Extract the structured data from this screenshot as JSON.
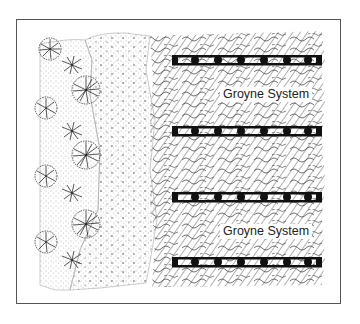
{
  "diagram": {
    "title": "",
    "labels": [
      {
        "text": "Groyne System",
        "x": 222,
        "y": 87
      },
      {
        "text": "Groyne System",
        "x": 222,
        "y": 224
      }
    ],
    "zones": [
      "vegetated dune with shrubs",
      "sand beach (stippled)",
      "water (hatched)"
    ],
    "groynes": [
      {
        "y": 60,
        "x1": 172,
        "x2": 322
      },
      {
        "y": 131,
        "x1": 172,
        "x2": 322
      },
      {
        "y": 197,
        "x1": 172,
        "x2": 322
      },
      {
        "y": 262,
        "x1": 172,
        "x2": 322
      }
    ],
    "shrubs": [
      {
        "x": 50,
        "y": 49,
        "r": 12
      },
      {
        "x": 72,
        "y": 65,
        "r": 11
      },
      {
        "x": 85,
        "y": 89,
        "r": 15
      },
      {
        "x": 46,
        "y": 108,
        "r": 12
      },
      {
        "x": 72,
        "y": 131,
        "r": 11
      },
      {
        "x": 86,
        "y": 155,
        "r": 15
      },
      {
        "x": 46,
        "y": 176,
        "r": 12
      },
      {
        "x": 72,
        "y": 191,
        "r": 11
      },
      {
        "x": 86,
        "y": 224,
        "r": 15
      },
      {
        "x": 46,
        "y": 242,
        "r": 12
      },
      {
        "x": 72,
        "y": 260,
        "r": 11
      }
    ],
    "colors": {
      "ink": "#1a1a1a",
      "frame": "#555555",
      "background": "#ffffff"
    }
  }
}
